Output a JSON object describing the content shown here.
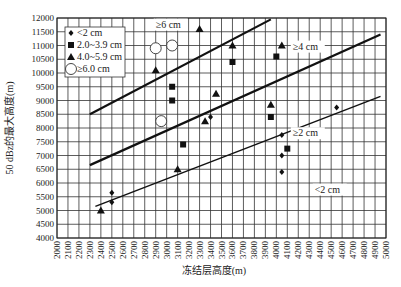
{
  "chart_data": {
    "type": "scatter",
    "title": "",
    "xlabel": "冻结层高度(m)",
    "ylabel": "50 dBz的最大高度(m)",
    "xlim": [
      2000,
      5000
    ],
    "ylim": [
      4000,
      12000
    ],
    "x_ticks": [
      2000,
      2100,
      2200,
      2300,
      2400,
      2500,
      2600,
      2700,
      2800,
      2900,
      3000,
      3100,
      3200,
      3300,
      3400,
      3500,
      3600,
      3700,
      3800,
      3900,
      4000,
      4100,
      4200,
      4300,
      4400,
      4500,
      4600,
      4700,
      4800,
      4900,
      5000
    ],
    "y_ticks": [
      4000,
      4500,
      5000,
      5500,
      6000,
      6500,
      7000,
      7500,
      8000,
      8500,
      9000,
      9500,
      10000,
      10500,
      11000,
      11500,
      12000
    ],
    "grid": true,
    "legend_position": "upper-left",
    "series": [
      {
        "name": "<2 cm",
        "marker": "diamond",
        "points": [
          [
            2500,
            5650
          ],
          [
            2500,
            5300
          ],
          [
            3400,
            8400
          ],
          [
            4050,
            7750
          ],
          [
            4050,
            7000
          ],
          [
            4050,
            6400
          ],
          [
            4550,
            8750
          ]
        ]
      },
      {
        "name": "2.0~3.9 cm",
        "marker": "square",
        "points": [
          [
            3050,
            9500
          ],
          [
            3050,
            9000
          ],
          [
            3150,
            7400
          ],
          [
            3600,
            10400
          ],
          [
            3950,
            8400
          ],
          [
            4000,
            10600
          ],
          [
            4100,
            7250
          ]
        ]
      },
      {
        "name": "4.0~5.9 cm",
        "marker": "triangle",
        "points": [
          [
            2400,
            5000
          ],
          [
            2900,
            10100
          ],
          [
            3100,
            6500
          ],
          [
            3300,
            11600
          ],
          [
            3350,
            8250
          ],
          [
            3450,
            9250
          ],
          [
            3600,
            11000
          ],
          [
            3950,
            8850
          ],
          [
            4050,
            11000
          ]
        ]
      },
      {
        "name": "≥6.0 cm",
        "marker": "circle",
        "points": [
          [
            2900,
            10900
          ],
          [
            3050,
            11000
          ],
          [
            2950,
            8250
          ]
        ]
      }
    ],
    "lines": [
      {
        "label": "≥6 cm",
        "from": [
          2300,
          8500
        ],
        "to": [
          3950,
          11950
        ],
        "width": 2.2
      },
      {
        "label": "≥4 cm",
        "from": [
          2300,
          6650
        ],
        "to": [
          4950,
          11400
        ],
        "width": 2.2
      },
      {
        "label": "≥2 cm",
        "from": [
          2350,
          5150
        ],
        "to": [
          4950,
          9150
        ],
        "width": 1.5
      }
    ],
    "annotations": [
      {
        "text": "≥6 cm",
        "at": [
          2900,
          11650
        ]
      },
      {
        "text": "≥4 cm",
        "at": [
          4150,
          10850
        ]
      },
      {
        "text": "≥2 cm",
        "at": [
          4150,
          7700
        ]
      },
      {
        "text": "<2 cm",
        "at": [
          4350,
          5650
        ]
      }
    ]
  }
}
